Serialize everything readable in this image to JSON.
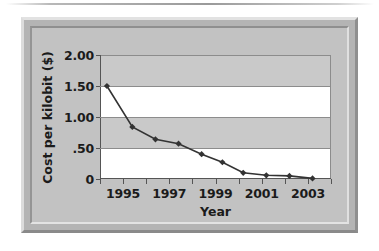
{
  "chart_data": {
    "type": "line",
    "title": "",
    "xlabel": "Year",
    "ylabel": "Cost per kilobit ($)",
    "x": [
      1994.3,
      1995.4,
      1996.4,
      1997.4,
      1998.4,
      1999.3,
      2000.2,
      2001.2,
      2002.2,
      2003.2
    ],
    "values": [
      1.5,
      0.84,
      0.64,
      0.57,
      0.4,
      0.27,
      0.1,
      0.06,
      0.05,
      0.01
    ],
    "series": [
      {
        "name": "Cost per kilobit",
        "values": [
          1.5,
          0.84,
          0.64,
          0.57,
          0.4,
          0.27,
          0.1,
          0.06,
          0.05,
          0.01
        ]
      }
    ],
    "xlim": [
      1994,
      2004
    ],
    "ylim": [
      0,
      2.0
    ],
    "xticks": [
      1994,
      1995,
      1996,
      1997,
      1998,
      1999,
      2000,
      2001,
      2002,
      2003,
      2004
    ],
    "xtick_labels": [
      "",
      "1995",
      "",
      "1997",
      "",
      "1999",
      "",
      "2001",
      "",
      "2003",
      ""
    ],
    "yticks": [
      0,
      0.5,
      1.0,
      1.5,
      2.0
    ],
    "ytick_labels": [
      "0",
      ".50",
      "1.00",
      "1.50",
      "2.00"
    ],
    "grid": true,
    "legend": null,
    "marker": "diamond",
    "line_color": "#333333",
    "marker_color": "#333333",
    "band_color": "#c9c9c9",
    "plot_background": "#ffffff",
    "frame_color": "#bdbdbd"
  },
  "figure": {
    "background": "#ffffff",
    "border_style": "beveled-gray-frame"
  }
}
